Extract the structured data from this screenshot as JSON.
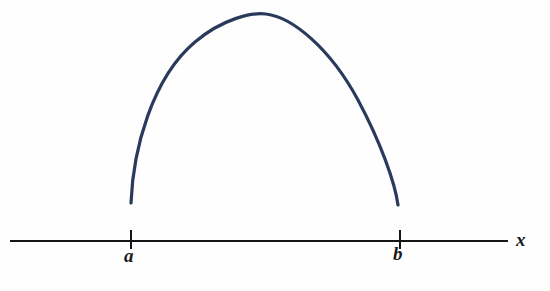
{
  "figure": {
    "background_color": "#fefefe",
    "curve_color": "#2a3a5c",
    "axis_color": "#161616"
  },
  "axis": {
    "name": "x",
    "label_x": "x",
    "line": {
      "x_start": 10,
      "x_end": 508,
      "y": 241
    },
    "ticks": [
      {
        "label": "a",
        "x": 131
      },
      {
        "label": "b",
        "x": 400
      }
    ]
  },
  "chart_data": {
    "type": "line",
    "title": "",
    "subtitle": "",
    "xlabel": "x",
    "ylabel": "",
    "grid": false,
    "legend": null,
    "annotations": [
      "a",
      "b",
      "x"
    ],
    "xticks": [
      "a",
      "b"
    ],
    "yticks": [],
    "xlim": [
      "a",
      "b"
    ],
    "series": [
      {
        "name": "f",
        "shape": "concave-down arch",
        "endpoints_open": true,
        "x": [
          131,
          140,
          152,
          166,
          182,
          200,
          220,
          243,
          265,
          288,
          310,
          330,
          348,
          364,
          378,
          390,
          398
        ],
        "y": [
          203,
          170,
          138,
          112,
          88,
          68,
          48,
          28,
          14,
          16,
          28,
          44,
          64,
          90,
          122,
          162,
          205
        ]
      }
    ]
  }
}
